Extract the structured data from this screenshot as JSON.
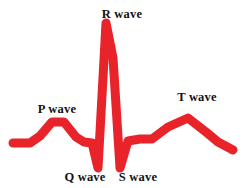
{
  "figure": {
    "name": "electrocardiogram-waveform-diagram",
    "background_color": "#ffffff"
  },
  "trace": {
    "name": "ecg-trace",
    "color": "#e8232a",
    "stroke_width": 9,
    "linejoin": "round",
    "linecap": "round"
  },
  "labels": {
    "p_wave": "P wave",
    "q_wave": "Q wave",
    "r_wave": "R wave",
    "s_wave": "S wave",
    "t_wave": "T wave"
  },
  "chart_data": {
    "type": "line",
    "title": "",
    "subtitle": "",
    "xlabel": "",
    "ylabel": "",
    "grid": false,
    "legend_position": "none",
    "axis_visible": false,
    "series": [
      {
        "name": "ECG trace",
        "color": "#e8232a",
        "points": [
          [
            13,
            143
          ],
          [
            30,
            143
          ],
          [
            40,
            136
          ],
          [
            52,
            122
          ],
          [
            64,
            122
          ],
          [
            76,
            137
          ],
          [
            84,
            142
          ],
          [
            92,
            143
          ],
          [
            98,
            168
          ],
          [
            106,
            23
          ],
          [
            113,
            58
          ],
          [
            120,
            168
          ],
          [
            128,
            141
          ],
          [
            140,
            139
          ],
          [
            152,
            139
          ],
          [
            168,
            127
          ],
          [
            188,
            118
          ],
          [
            206,
            132
          ],
          [
            218,
            142
          ],
          [
            233,
            150
          ]
        ]
      }
    ],
    "annotations": [
      {
        "label": "P wave",
        "x": 57,
        "y": 122,
        "text_x": 57,
        "text_y": 110,
        "position": "above"
      },
      {
        "label": "R wave",
        "x": 106,
        "y": 23,
        "text_x": 122,
        "text_y": 15,
        "position": "above"
      },
      {
        "label": "T wave",
        "x": 188,
        "y": 118,
        "text_x": 197,
        "text_y": 98,
        "position": "above"
      },
      {
        "label": "Q wave",
        "x": 98,
        "y": 168,
        "text_x": 85,
        "text_y": 178,
        "position": "below"
      },
      {
        "label": "S wave",
        "x": 120,
        "y": 168,
        "text_x": 138,
        "text_y": 178,
        "position": "below"
      }
    ],
    "xlim": [
      0,
      245
    ],
    "ylim": [
      188,
      0
    ],
    "baseline_y": 143
  }
}
